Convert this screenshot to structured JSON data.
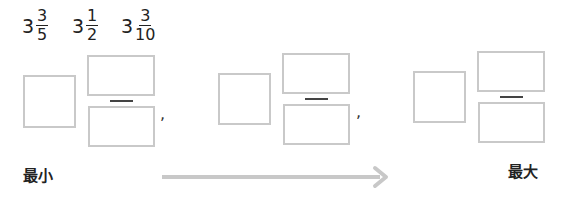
{
  "given_numbers": [
    {
      "whole": "3",
      "numerator": "3",
      "denominator": "5"
    },
    {
      "whole": "3",
      "numerator": "1",
      "denominator": "2"
    },
    {
      "whole": "3",
      "numerator": "3",
      "denominator": "10"
    }
  ],
  "answer_slots": [
    {
      "whole": "",
      "numerator": "",
      "denominator": ""
    },
    {
      "whole": "",
      "numerator": "",
      "denominator": ""
    },
    {
      "whole": "",
      "numerator": "",
      "denominator": ""
    }
  ],
  "separator": ",",
  "order_labels": {
    "min": "最小",
    "max": "最大"
  },
  "colors": {
    "box_border": "#c9c9c9",
    "arrow": "#c8c8c8",
    "text": "#222222"
  }
}
